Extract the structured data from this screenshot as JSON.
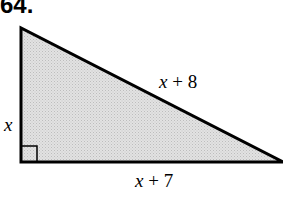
{
  "problem": {
    "number": "64."
  },
  "figure": {
    "shape": "right-triangle",
    "fill_color": "#d9d9d9",
    "stroke_color": "#000000",
    "right_angle_marker": true,
    "sides": {
      "vertical_leg": {
        "label": "x",
        "var": "x",
        "const": ""
      },
      "hypotenuse": {
        "label": "x + 8",
        "var": "x",
        "op": " + ",
        "const": "8"
      },
      "horizontal_leg": {
        "label": "x + 7",
        "var": "x",
        "op": " + ",
        "const": "7"
      }
    }
  }
}
